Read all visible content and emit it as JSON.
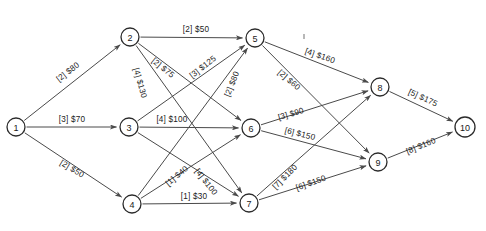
{
  "diagram": {
    "type": "directed-graph",
    "width": 486,
    "height": 231,
    "background_color": "#ffffff",
    "node_stroke_color": "#2b2b2b",
    "edge_color": "#4a4a4a",
    "text_color": "#1a1a1a",
    "nodes": [
      {
        "id": "1",
        "label": "1",
        "x": 16,
        "y": 127,
        "r": 9
      },
      {
        "id": "2",
        "label": "2",
        "x": 130,
        "y": 37,
        "r": 9
      },
      {
        "id": "3",
        "label": "3",
        "x": 129,
        "y": 127,
        "r": 9
      },
      {
        "id": "4",
        "label": "4",
        "x": 132,
        "y": 204,
        "r": 9
      },
      {
        "id": "5",
        "label": "5",
        "x": 255,
        "y": 38,
        "r": 9
      },
      {
        "id": "6",
        "label": "6",
        "x": 251,
        "y": 128,
        "r": 9
      },
      {
        "id": "7",
        "label": "7",
        "x": 249,
        "y": 203,
        "r": 9
      },
      {
        "id": "8",
        "label": "8",
        "x": 380,
        "y": 87,
        "r": 9
      },
      {
        "id": "9",
        "label": "9",
        "x": 378,
        "y": 162,
        "r": 9
      },
      {
        "id": "10",
        "label": "10",
        "x": 465,
        "y": 127,
        "r": 10
      }
    ],
    "edges": [
      {
        "from": "1",
        "to": "2",
        "capacity": "2",
        "cost": "$80",
        "label": "[2] $80",
        "lx": 68,
        "ly": 72,
        "rotate": -38
      },
      {
        "from": "1",
        "to": "3",
        "capacity": "3",
        "cost": "$70",
        "label": "[3] $70",
        "lx": 72,
        "ly": 119,
        "rotate": 0
      },
      {
        "from": "1",
        "to": "4",
        "capacity": "2",
        "cost": "$50",
        "label": "[2] $50",
        "lx": 72,
        "ly": 169,
        "rotate": 31
      },
      {
        "from": "2",
        "to": "5",
        "capacity": "2",
        "cost": "$50",
        "label": "[2] $50",
        "lx": 196,
        "ly": 29,
        "rotate": 0
      },
      {
        "from": "2",
        "to": "6",
        "capacity": "2",
        "cost": "$75",
        "label": "[2] $75",
        "lx": 163,
        "ly": 68,
        "rotate": 39
      },
      {
        "from": "2",
        "to": "7",
        "capacity": "4",
        "cost": "$130",
        "label": "[4] $130",
        "lx": 140,
        "ly": 83,
        "rotate": 74
      },
      {
        "from": "3",
        "to": "5",
        "capacity": "3",
        "cost": "$125",
        "label": "[3] $125",
        "lx": 203,
        "ly": 67,
        "rotate": -38
      },
      {
        "from": "3",
        "to": "6",
        "capacity": "4",
        "cost": "$100",
        "label": "[4] $100",
        "lx": 172,
        "ly": 119,
        "rotate": 0
      },
      {
        "from": "3",
        "to": "7",
        "capacity": "4",
        "cost": "$100",
        "label": "[4] $100",
        "lx": 206,
        "ly": 182,
        "rotate": 52
      },
      {
        "from": "4",
        "to": "5",
        "capacity": "2",
        "cost": "$80",
        "label": "[2] $80",
        "lx": 232,
        "ly": 84,
        "rotate": -68
      },
      {
        "from": "4",
        "to": "6",
        "capacity": "1",
        "cost": "$40",
        "label": "[1] $40",
        "lx": 177,
        "ly": 176,
        "rotate": -40
      },
      {
        "from": "4",
        "to": "7",
        "capacity": "1",
        "cost": "$30",
        "label": "[1] $30",
        "lx": 194,
        "ly": 196,
        "rotate": 0
      },
      {
        "from": "5",
        "to": "8",
        "capacity": "4",
        "cost": "$160",
        "label": "[4] $160",
        "lx": 320,
        "ly": 56,
        "rotate": 19
      },
      {
        "from": "5",
        "to": "9",
        "capacity": "2",
        "cost": "$60",
        "label": "[2] $60",
        "lx": 289,
        "ly": 80,
        "rotate": 41
      },
      {
        "from": "6",
        "to": "8",
        "capacity": "3",
        "cost": "$90",
        "label": "[3] $90",
        "lx": 291,
        "ly": 114,
        "rotate": -16
      },
      {
        "from": "6",
        "to": "9",
        "capacity": "6",
        "cost": "$150",
        "label": "[6] $150",
        "lx": 300,
        "ly": 134,
        "rotate": 14
      },
      {
        "from": "7",
        "to": "8",
        "capacity": "7",
        "cost": "$180",
        "label": "[7] $180",
        "lx": 285,
        "ly": 177,
        "rotate": -45
      },
      {
        "from": "7",
        "to": "9",
        "capacity": "6",
        "cost": "$150",
        "label": "[6] $150",
        "lx": 311,
        "ly": 183,
        "rotate": -19
      },
      {
        "from": "8",
        "to": "10",
        "capacity": "5",
        "cost": "$175",
        "label": "[5] $175",
        "lx": 423,
        "ly": 98,
        "rotate": 25
      },
      {
        "from": "9",
        "to": "10",
        "capacity": "8",
        "cost": "$160",
        "label": "[8] $160",
        "lx": 421,
        "ly": 146,
        "rotate": -22
      }
    ]
  }
}
